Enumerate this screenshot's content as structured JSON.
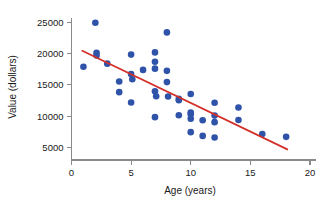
{
  "chart_data": {
    "type": "scatter",
    "title": "",
    "xlabel": "Age (years)",
    "ylabel": "Value (dollars)",
    "xlim": [
      0,
      20
    ],
    "ylim": [
      3000,
      26500
    ],
    "xticks": [
      0,
      5,
      10,
      15,
      20
    ],
    "yticks": [
      5000,
      10000,
      15000,
      20000,
      25000
    ],
    "xticklabels": [
      "0",
      "5",
      "10",
      "15",
      "20"
    ],
    "yticklabels": [
      "5000",
      "10000",
      "15000",
      "20000",
      "25000"
    ],
    "grid": false,
    "legend": null,
    "marker_color": "#2e53a8",
    "marker_shape": "circle",
    "marker_size": 3.3,
    "points": [
      {
        "x": 1.0,
        "y": 17900
      },
      {
        "x": 2.0,
        "y": 24950
      },
      {
        "x": 2.1,
        "y": 20150
      },
      {
        "x": 2.1,
        "y": 19700
      },
      {
        "x": 3.0,
        "y": 18400
      },
      {
        "x": 4.0,
        "y": 15550
      },
      {
        "x": 4.0,
        "y": 13850
      },
      {
        "x": 5.0,
        "y": 19850
      },
      {
        "x": 5.0,
        "y": 16750
      },
      {
        "x": 5.1,
        "y": 15900
      },
      {
        "x": 5.0,
        "y": 12200
      },
      {
        "x": 6.0,
        "y": 17400
      },
      {
        "x": 7.0,
        "y": 20200
      },
      {
        "x": 7.0,
        "y": 18700
      },
      {
        "x": 7.0,
        "y": 17600
      },
      {
        "x": 7.0,
        "y": 14000
      },
      {
        "x": 7.1,
        "y": 13200
      },
      {
        "x": 7.0,
        "y": 9850
      },
      {
        "x": 8.0,
        "y": 23400
      },
      {
        "x": 8.0,
        "y": 17250
      },
      {
        "x": 8.0,
        "y": 15450
      },
      {
        "x": 8.1,
        "y": 13150
      },
      {
        "x": 9.0,
        "y": 12800
      },
      {
        "x": 9.0,
        "y": 12550
      },
      {
        "x": 9.0,
        "y": 10150
      },
      {
        "x": 10.0,
        "y": 13550
      },
      {
        "x": 10.0,
        "y": 10600
      },
      {
        "x": 10.0,
        "y": 10300
      },
      {
        "x": 10.0,
        "y": 9600
      },
      {
        "x": 10.0,
        "y": 7450
      },
      {
        "x": 11.0,
        "y": 9350
      },
      {
        "x": 11.0,
        "y": 6850
      },
      {
        "x": 12.0,
        "y": 12150
      },
      {
        "x": 12.0,
        "y": 10100
      },
      {
        "x": 12.0,
        "y": 9050
      },
      {
        "x": 12.0,
        "y": 6600
      },
      {
        "x": 14.0,
        "y": 11400
      },
      {
        "x": 14.0,
        "y": 9400
      },
      {
        "x": 16.0,
        "y": 7150
      },
      {
        "x": 18.0,
        "y": 6700
      }
    ],
    "trendline": {
      "color": "#d42f28",
      "x_start": 0.9,
      "y_start": 20450,
      "x_end": 18.1,
      "y_end": 4700
    }
  }
}
